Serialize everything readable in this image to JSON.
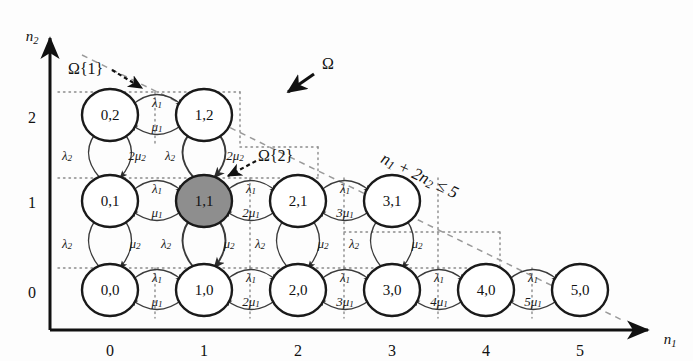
{
  "figure": {
    "type": "markov-chain-state-transition-diagram",
    "background": "#fdfdfd",
    "axes": {
      "x": {
        "name": "n",
        "name_sub": "1",
        "ticks": [
          "0",
          "1",
          "2",
          "3",
          "4",
          "5"
        ]
      },
      "y": {
        "name": "n",
        "name_sub": "2",
        "ticks": [
          "0",
          "1",
          "2"
        ]
      }
    },
    "constraint": {
      "text": "n1 + 2n2 ≤ 5",
      "parts": [
        "n",
        "1",
        " + 2",
        "n",
        "2",
        " ≤ 5"
      ]
    },
    "annotations": [
      {
        "name": "omega-region",
        "text": "Ω"
      },
      {
        "name": "omega-set-1",
        "text": "Ω{1}"
      },
      {
        "name": "omega-set-2",
        "text": "Ω{2}"
      }
    ],
    "colors": {
      "node_fill": "#ffffff",
      "node_fill_highlight": "#8e8e8e",
      "node_stroke": "#1a1a1a",
      "arrow": "#3a3a3a",
      "boundary_dashed": "#9a9a9a",
      "grid_dotted": "#8a8a8a",
      "axis": "#111111"
    },
    "states": [
      {
        "id": "0,0",
        "label": "0,0",
        "n1": 0,
        "n2": 0,
        "highlight": false
      },
      {
        "id": "1,0",
        "label": "1,0",
        "n1": 1,
        "n2": 0,
        "highlight": false
      },
      {
        "id": "2,0",
        "label": "2,0",
        "n1": 2,
        "n2": 0,
        "highlight": false
      },
      {
        "id": "3,0",
        "label": "3,0",
        "n1": 3,
        "n2": 0,
        "highlight": false
      },
      {
        "id": "4,0",
        "label": "4,0",
        "n1": 4,
        "n2": 0,
        "highlight": false
      },
      {
        "id": "5,0",
        "label": "5,0",
        "n1": 5,
        "n2": 0,
        "highlight": false
      },
      {
        "id": "0,1",
        "label": "0,1",
        "n1": 0,
        "n2": 1,
        "highlight": false
      },
      {
        "id": "1,1",
        "label": "1,1",
        "n1": 1,
        "n2": 1,
        "highlight": true
      },
      {
        "id": "2,1",
        "label": "2,1",
        "n1": 2,
        "n2": 1,
        "highlight": false
      },
      {
        "id": "3,1",
        "label": "3,1",
        "n1": 3,
        "n2": 1,
        "highlight": false
      },
      {
        "id": "0,2",
        "label": "0,2",
        "n1": 0,
        "n2": 2,
        "highlight": false
      },
      {
        "id": "1,2",
        "label": "1,2",
        "n1": 1,
        "n2": 2,
        "highlight": false
      }
    ],
    "horizontal_rates": [
      {
        "from": "0,0",
        "to": "1,0",
        "forward": "λ",
        "forward_sub": "1",
        "backward": "μ",
        "backward_sub": "1",
        "backward_coeff": ""
      },
      {
        "from": "1,0",
        "to": "2,0",
        "forward": "λ",
        "forward_sub": "1",
        "backward": "μ",
        "backward_sub": "1",
        "backward_coeff": "2"
      },
      {
        "from": "2,0",
        "to": "3,0",
        "forward": "λ",
        "forward_sub": "1",
        "backward": "μ",
        "backward_sub": "1",
        "backward_coeff": "3"
      },
      {
        "from": "3,0",
        "to": "4,0",
        "forward": "λ",
        "forward_sub": "1",
        "backward": "μ",
        "backward_sub": "1",
        "backward_coeff": "4"
      },
      {
        "from": "4,0",
        "to": "5,0",
        "forward": "λ",
        "forward_sub": "1",
        "backward": "μ",
        "backward_sub": "1",
        "backward_coeff": "5"
      },
      {
        "from": "0,1",
        "to": "1,1",
        "forward": "λ",
        "forward_sub": "1",
        "backward": "μ",
        "backward_sub": "1",
        "backward_coeff": ""
      },
      {
        "from": "1,1",
        "to": "2,1",
        "forward": "λ",
        "forward_sub": "1",
        "backward": "μ",
        "backward_sub": "1",
        "backward_coeff": "2"
      },
      {
        "from": "2,1",
        "to": "3,1",
        "forward": "λ",
        "forward_sub": "1",
        "backward": "μ",
        "backward_sub": "1",
        "backward_coeff": "3"
      },
      {
        "from": "0,2",
        "to": "1,2",
        "forward": "λ",
        "forward_sub": "1",
        "backward": "μ",
        "backward_sub": "1",
        "backward_coeff": ""
      }
    ],
    "vertical_rates": [
      {
        "from": "0,0",
        "to": "0,1",
        "up": "λ",
        "up_sub": "2",
        "down": "μ",
        "down_sub": "2",
        "down_coeff": ""
      },
      {
        "from": "1,0",
        "to": "1,1",
        "up": "λ",
        "up_sub": "2",
        "down": "μ",
        "down_sub": "2",
        "down_coeff": ""
      },
      {
        "from": "2,0",
        "to": "2,1",
        "up": "λ",
        "up_sub": "2",
        "down": "μ",
        "down_sub": "2",
        "down_coeff": ""
      },
      {
        "from": "3,0",
        "to": "3,1",
        "up": "λ",
        "up_sub": "2",
        "down": "μ",
        "down_sub": "2",
        "down_coeff": ""
      },
      {
        "from": "0,1",
        "to": "0,2",
        "up": "λ",
        "up_sub": "2",
        "down": "μ",
        "down_sub": "2",
        "down_coeff": "2"
      },
      {
        "from": "1,1",
        "to": "1,2",
        "up": "λ",
        "up_sub": "2",
        "down": "μ",
        "down_sub": "2",
        "down_coeff": "2"
      }
    ]
  }
}
